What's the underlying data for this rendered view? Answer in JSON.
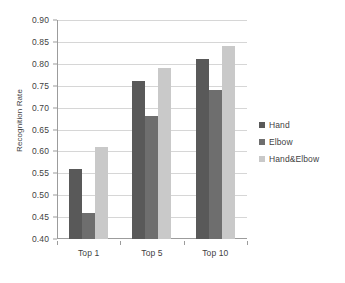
{
  "chart_data": {
    "type": "bar",
    "title": "",
    "xlabel": "",
    "ylabel": "Recognition Rate",
    "categories": [
      "Top 1",
      "Top 5",
      "Top 10"
    ],
    "series": [
      {
        "name": "Hand",
        "color": "#595959",
        "values": [
          0.56,
          0.76,
          0.81
        ]
      },
      {
        "name": "Elbow",
        "color": "#6e6e6e",
        "values": [
          0.46,
          0.68,
          0.74
        ]
      },
      {
        "name": "Hand&Elbow",
        "color": "#c9c9c9",
        "values": [
          0.61,
          0.79,
          0.84
        ]
      }
    ],
    "ylim": [
      0.4,
      0.9
    ],
    "ytick_labels": [
      "0.40",
      "0.45",
      "0.50",
      "0.55",
      "0.60",
      "0.65",
      "0.70",
      "0.75",
      "0.80",
      "0.85",
      "0.90"
    ],
    "ytick_values": [
      0.4,
      0.45,
      0.5,
      0.55,
      0.6,
      0.65,
      0.7,
      0.75,
      0.8,
      0.85,
      0.9
    ],
    "grid": true,
    "grid_axis": "y",
    "legend_position": "right",
    "axis_color": "#9c9c9c",
    "grid_color": "#d6d6d6",
    "text_color": "#3f3f3f",
    "background": "#ffffff"
  }
}
